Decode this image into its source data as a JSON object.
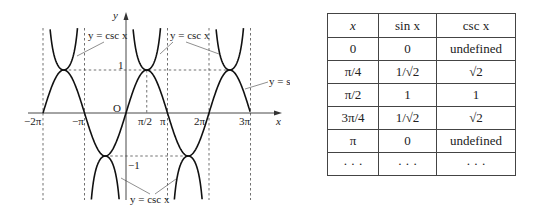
{
  "graph": {
    "axis_labels": {
      "x": "x",
      "y": "y",
      "origin": "O"
    },
    "x_ticks": [
      "−2π",
      "−π",
      "π/2",
      "π",
      "2π",
      "3π"
    ],
    "y_ticks": [
      "1",
      "−1"
    ],
    "annotations": {
      "csc_top_left": "y = csc x",
      "csc_top_right": "y = csc x",
      "sin": "y = sin x",
      "csc_bottom": "y = csc x"
    }
  },
  "table": {
    "headers": [
      "x",
      "sin x",
      "csc x"
    ],
    "rows": [
      [
        "0",
        "0",
        "undefined"
      ],
      [
        "π/4",
        "1/√2",
        "√2"
      ],
      [
        "π/2",
        "1",
        "1"
      ],
      [
        "3π/4",
        "1/√2",
        "√2"
      ],
      [
        "π",
        "0",
        "undefined"
      ],
      [
        "· · ·",
        "· · ·",
        "· · ·"
      ]
    ]
  },
  "chart_data": {
    "type": "line",
    "title": "",
    "xlabel": "x",
    "ylabel": "y",
    "xlim": [
      -6.6,
      10.0
    ],
    "ylim": [
      -2.3,
      2.3
    ],
    "x_tick_labels": [
      "−2π",
      "−π",
      "π/2",
      "π",
      "2π",
      "3π"
    ],
    "y_tick_labels": [
      "1",
      "−1"
    ],
    "asymptotes": [
      "−2π",
      "−π",
      "π",
      "2π",
      "3π"
    ],
    "series": [
      {
        "name": "y = sin x",
        "x": [
          "−2π",
          "−3π/2",
          "−π",
          "−π/2",
          "0",
          "π/2",
          "π",
          "3π/2",
          "2π",
          "5π/2",
          "3π"
        ],
        "values": [
          0,
          1,
          0,
          -1,
          0,
          1,
          0,
          -1,
          0,
          1,
          0
        ]
      },
      {
        "name": "y = csc x",
        "x": [
          "−3π/2",
          "−π/2",
          "π/2",
          "3π/2",
          "5π/2"
        ],
        "values": [
          1,
          -1,
          1,
          -1,
          1
        ]
      }
    ]
  }
}
